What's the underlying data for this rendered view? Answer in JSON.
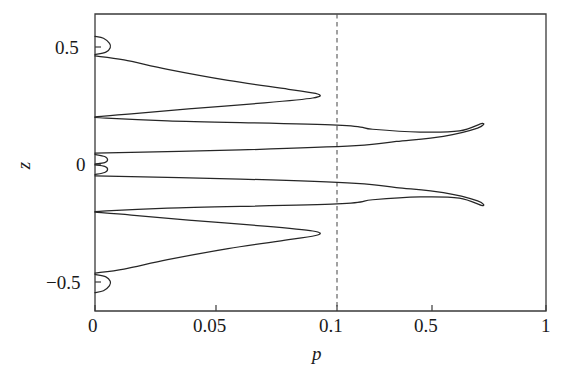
{
  "chart_data": {
    "type": "line",
    "title": "",
    "xlabel": "p",
    "ylabel": "z",
    "xscale": "nonlinear-custom",
    "xticks": [
      0,
      0.05,
      0.1,
      0.5,
      1
    ],
    "xtick_labels": [
      "0",
      "0.05",
      "0.1",
      "0.5",
      "1"
    ],
    "xlim": [
      0,
      1
    ],
    "yticks": [
      0.5,
      0,
      -0.5
    ],
    "ytick_labels": [
      "0.5",
      "0",
      "−0.5"
    ],
    "ylim": [
      -0.62,
      0.62
    ],
    "grid": false,
    "legend": null,
    "annotations": [
      {
        "type": "vline",
        "x": 0.1,
        "style": "dashed",
        "label": ""
      }
    ],
    "series": [
      {
        "name": "tongue-1-upper",
        "comment": "small closed tongue near z=0.5, apex near p=0.007",
        "points": [
          [
            0.0,
            0.545
          ],
          [
            0.0035,
            0.537
          ],
          [
            0.006,
            0.515
          ],
          [
            0.0063,
            0.497
          ],
          [
            0.0045,
            0.478
          ],
          [
            0.0,
            0.468
          ]
        ]
      },
      {
        "name": "tongue-2-upper",
        "comment": "medium tongue with apex near p=0.09, between z=0.46 and z=0.20",
        "points": [
          [
            0.0,
            0.462
          ],
          [
            0.012,
            0.445
          ],
          [
            0.03,
            0.405
          ],
          [
            0.055,
            0.358
          ],
          [
            0.08,
            0.32
          ],
          [
            0.092,
            0.3
          ],
          [
            0.09,
            0.283
          ],
          [
            0.07,
            0.262
          ],
          [
            0.04,
            0.238
          ],
          [
            0.015,
            0.215
          ],
          [
            0.0,
            0.203
          ]
        ]
      },
      {
        "name": "tongue-3-upper",
        "comment": "large tongue with apex near p=0.72, between z=0.20 and z=0.045",
        "points": [
          [
            0.0,
            0.2
          ],
          [
            0.03,
            0.186
          ],
          [
            0.1,
            0.168
          ],
          [
            0.25,
            0.15
          ],
          [
            0.45,
            0.138
          ],
          [
            0.62,
            0.143
          ],
          [
            0.72,
            0.175
          ],
          [
            0.7,
            0.155
          ],
          [
            0.55,
            0.12
          ],
          [
            0.35,
            0.098
          ],
          [
            0.18,
            0.08
          ],
          [
            0.06,
            0.062
          ],
          [
            0.0,
            0.048
          ]
        ]
      },
      {
        "name": "tongue-4-upper",
        "comment": "tiny tongue just above z=0",
        "points": [
          [
            0.0,
            0.043
          ],
          [
            0.004,
            0.034
          ],
          [
            0.0052,
            0.02
          ],
          [
            0.004,
            0.008
          ],
          [
            0.0,
            0.002
          ]
        ]
      },
      {
        "name": "tongue-4-lower",
        "comment": "mirror of tongue-4 just below z=0",
        "points": [
          [
            0.0,
            -0.002
          ],
          [
            0.004,
            -0.008
          ],
          [
            0.0052,
            -0.02
          ],
          [
            0.004,
            -0.034
          ],
          [
            0.0,
            -0.043
          ]
        ]
      },
      {
        "name": "tongue-3-lower",
        "comment": "mirror large tongue, apex near p=0.72",
        "points": [
          [
            0.0,
            -0.048
          ],
          [
            0.06,
            -0.062
          ],
          [
            0.18,
            -0.08
          ],
          [
            0.35,
            -0.098
          ],
          [
            0.55,
            -0.12
          ],
          [
            0.7,
            -0.155
          ],
          [
            0.72,
            -0.175
          ],
          [
            0.62,
            -0.143
          ],
          [
            0.45,
            -0.138
          ],
          [
            0.25,
            -0.15
          ],
          [
            0.1,
            -0.168
          ],
          [
            0.03,
            -0.186
          ],
          [
            0.0,
            -0.2
          ]
        ]
      },
      {
        "name": "tongue-2-lower",
        "comment": "mirror medium tongue, apex near p=0.09",
        "points": [
          [
            0.0,
            -0.203
          ],
          [
            0.015,
            -0.215
          ],
          [
            0.04,
            -0.238
          ],
          [
            0.07,
            -0.262
          ],
          [
            0.09,
            -0.283
          ],
          [
            0.092,
            -0.3
          ],
          [
            0.08,
            -0.32
          ],
          [
            0.055,
            -0.358
          ],
          [
            0.03,
            -0.405
          ],
          [
            0.012,
            -0.445
          ],
          [
            0.0,
            -0.462
          ]
        ]
      },
      {
        "name": "tongue-1-lower",
        "comment": "mirror small closed tongue near z=-0.5",
        "points": [
          [
            0.0,
            -0.468
          ],
          [
            0.0045,
            -0.478
          ],
          [
            0.0063,
            -0.497
          ],
          [
            0.006,
            -0.515
          ],
          [
            0.0035,
            -0.537
          ],
          [
            0.0,
            -0.545
          ]
        ]
      }
    ],
    "colors": {
      "curve": "#262626",
      "axis": "#3a3a3a",
      "dashed_guide": "#555555",
      "background": "#ffffff"
    }
  },
  "labels": {
    "x_ticks": [
      "0",
      "0.05",
      "0.1",
      "0.5",
      "1"
    ],
    "y_ticks": [
      "0.5",
      "0",
      "−0.5"
    ],
    "x_axis_title": "p",
    "y_axis_title": "z"
  }
}
